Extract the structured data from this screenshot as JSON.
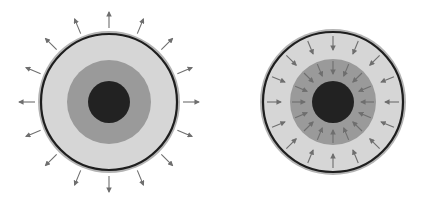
{
  "figure": {
    "width": 427,
    "height": 203,
    "background": "#ffffff",
    "colors": {
      "rim": "#b4b4b4",
      "ring_line": "#1e1e1e",
      "outer_fill": "#d6d6d6",
      "middle_fill": "#9a9a9a",
      "core_fill": "#222222",
      "arrow": "#6e6e6e"
    },
    "diagrams": [
      {
        "name": "outward-flow-sphere",
        "cx": 109,
        "cy": 102,
        "rim_r": 71,
        "ring_r": 68,
        "outer_r": 66,
        "middle_r": 42,
        "core_r": 21,
        "arrow_direction": "outward",
        "arrow_count": 16,
        "arrow_from_r": 74,
        "arrow_to_r": 90
      },
      {
        "name": "inward-flow-sphere",
        "cx": 333,
        "cy": 102,
        "rim_r": 73,
        "ring_r": 70,
        "outer_r": 68,
        "middle_r": 43,
        "core_r": 21,
        "arrow_direction": "inward",
        "arrow_count": 16,
        "arrow_from_r": 66,
        "arrow_to_r": 52,
        "inner_arrow_count": 16,
        "inner_arrow_from_r": 41,
        "inner_arrow_to_r": 28
      }
    ]
  }
}
